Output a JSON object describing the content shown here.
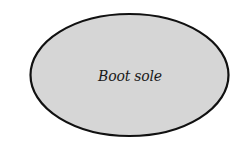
{
  "diagram": {
    "shape": {
      "type": "ellipse",
      "label": "Boot sole",
      "fill": "#d6d6d6",
      "stroke": "#111111"
    }
  }
}
